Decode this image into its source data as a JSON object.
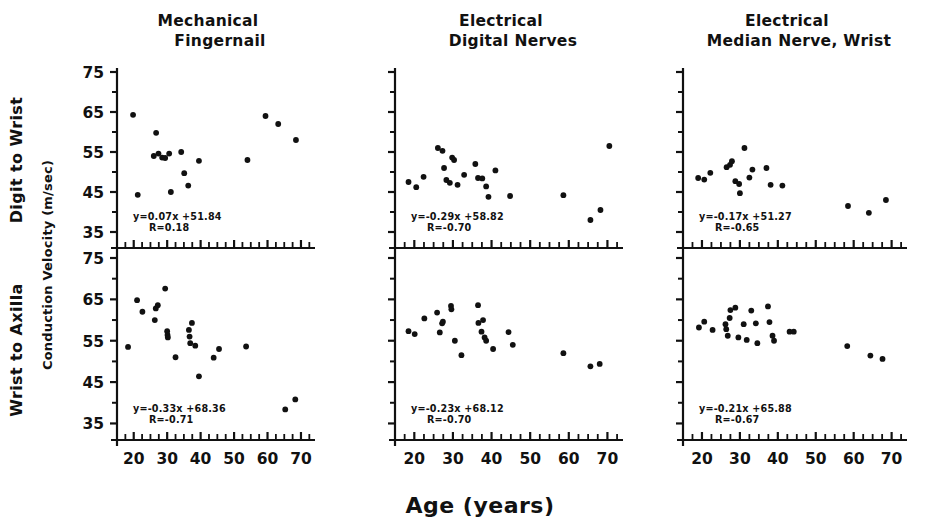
{
  "figure": {
    "x_axis_title": "Age (years)",
    "y_axis_title": "Conduction Velocity (m/sec)",
    "row_labels": [
      "Digit to Wrist",
      "Wrist to Axilla"
    ],
    "column_titles": [
      {
        "line1": "Mechanical",
        "line2": "Fingernail"
      },
      {
        "line1": "Electrical",
        "line2": "Digital Nerves"
      },
      {
        "line1": "Electrical",
        "line2": "Median Nerve, Wrist"
      }
    ],
    "y_ticks": [
      "75",
      "65",
      "55",
      "45",
      "35"
    ],
    "x_ticks": [
      "20",
      "30",
      "40",
      "50",
      "60",
      "70"
    ],
    "ink_color": "#111111",
    "background_color": "#ffffff"
  },
  "chart_data": [
    {
      "id": "panel-top-left",
      "type": "scatter",
      "title": "Mechanical Fingernail",
      "row": "Digit to Wrist",
      "xlabel": "Age (years)",
      "ylabel": "Conduction Velocity (m/sec)",
      "xlim": [
        15,
        73
      ],
      "ylim": [
        31,
        75
      ],
      "xticks": [
        20,
        30,
        40,
        50,
        60,
        70
      ],
      "yticks": [
        35,
        45,
        55,
        65,
        75
      ],
      "grid": false,
      "fit_equation": "y=0.07x +51.84",
      "fit_r": "R=0.18",
      "slope": 0.07,
      "intercept": 51.84,
      "r": 0.18,
      "points": [
        [
          19.8,
          64.3
        ],
        [
          21.2,
          44.3
        ],
        [
          26.0,
          54.0
        ],
        [
          26.7,
          59.8
        ],
        [
          27.4,
          54.6
        ],
        [
          28.5,
          53.6
        ],
        [
          29.4,
          53.5
        ],
        [
          30.6,
          54.6
        ],
        [
          31.1,
          45.0
        ],
        [
          34.2,
          55.0
        ],
        [
          35.1,
          49.7
        ],
        [
          36.3,
          46.6
        ],
        [
          39.5,
          52.8
        ],
        [
          54.0,
          53.0
        ],
        [
          59.4,
          64.0
        ],
        [
          63.2,
          62.0
        ],
        [
          68.5,
          58.0
        ]
      ]
    },
    {
      "id": "panel-top-middle",
      "type": "scatter",
      "title": "Electrical Digital Nerves",
      "row": "Digit to Wrist",
      "xlabel": "Age (years)",
      "ylabel": "Conduction Velocity (m/sec)",
      "xlim": [
        15,
        73
      ],
      "ylim": [
        31,
        75
      ],
      "xticks": [
        20,
        30,
        40,
        50,
        60,
        70
      ],
      "yticks": [
        35,
        45,
        55,
        65,
        75
      ],
      "grid": false,
      "fit_equation": "y=-0.29x +58.82",
      "fit_r": "R=-0.70",
      "slope": -0.29,
      "intercept": 58.82,
      "r": -0.7,
      "points": [
        [
          18.5,
          47.5
        ],
        [
          20.5,
          46.2
        ],
        [
          22.4,
          48.8
        ],
        [
          26.1,
          56.0
        ],
        [
          27.3,
          55.3
        ],
        [
          27.7,
          51.0
        ],
        [
          28.3,
          48.0
        ],
        [
          29.2,
          47.3
        ],
        [
          29.8,
          53.6
        ],
        [
          30.3,
          53.0
        ],
        [
          31.2,
          46.8
        ],
        [
          32.9,
          49.3
        ],
        [
          35.8,
          52.0
        ],
        [
          36.5,
          48.5
        ],
        [
          37.6,
          48.4
        ],
        [
          38.6,
          46.4
        ],
        [
          39.2,
          43.8
        ],
        [
          41.0,
          50.4
        ],
        [
          44.8,
          44.0
        ],
        [
          58.6,
          44.2
        ],
        [
          65.6,
          38.0
        ],
        [
          68.2,
          40.5
        ],
        [
          70.5,
          56.5
        ]
      ]
    },
    {
      "id": "panel-top-right",
      "type": "scatter",
      "title": "Electrical Median Nerve, Wrist",
      "row": "Digit to Wrist",
      "xlabel": "Age (years)",
      "ylabel": "Conduction Velocity (m/sec)",
      "xlim": [
        15,
        73
      ],
      "ylim": [
        31,
        75
      ],
      "xticks": [
        20,
        30,
        40,
        50,
        60,
        70
      ],
      "yticks": [
        35,
        45,
        55,
        65,
        75
      ],
      "grid": false,
      "fit_equation": "y=-0.17x +51.27",
      "fit_r": "R=-0.65",
      "slope": -0.17,
      "intercept": 51.27,
      "r": -0.65,
      "points": [
        [
          19.0,
          48.5
        ],
        [
          20.6,
          48.1
        ],
        [
          22.2,
          49.8
        ],
        [
          26.5,
          51.2
        ],
        [
          27.4,
          51.8
        ],
        [
          27.9,
          52.7
        ],
        [
          28.8,
          47.7
        ],
        [
          29.8,
          47.0
        ],
        [
          30.0,
          44.7
        ],
        [
          31.2,
          56.0
        ],
        [
          32.5,
          48.6
        ],
        [
          33.3,
          50.6
        ],
        [
          37.0,
          51.0
        ],
        [
          38.1,
          46.8
        ],
        [
          41.2,
          46.6
        ],
        [
          58.5,
          41.5
        ],
        [
          64.0,
          39.8
        ],
        [
          68.5,
          43.0
        ]
      ]
    },
    {
      "id": "panel-bottom-left",
      "type": "scatter",
      "title": "Mechanical Fingernail",
      "row": "Wrist to Axilla",
      "xlabel": "Age (years)",
      "ylabel": "Conduction Velocity (m/sec)",
      "xlim": [
        15,
        73
      ],
      "ylim": [
        31,
        75
      ],
      "xticks": [
        20,
        30,
        40,
        50,
        60,
        70
      ],
      "yticks": [
        35,
        45,
        55,
        65,
        75
      ],
      "grid": false,
      "fit_equation": "y=-0.33x +68.36",
      "fit_r": "R=-0.71",
      "slope": -0.33,
      "intercept": 68.36,
      "r": -0.71,
      "points": [
        [
          18.3,
          53.5
        ],
        [
          21.0,
          64.8
        ],
        [
          22.6,
          62.0
        ],
        [
          26.3,
          60.0
        ],
        [
          26.6,
          62.8
        ],
        [
          27.2,
          63.6
        ],
        [
          29.4,
          67.6
        ],
        [
          30.0,
          57.3
        ],
        [
          30.1,
          56.4
        ],
        [
          30.2,
          55.8
        ],
        [
          32.5,
          51.0
        ],
        [
          36.5,
          57.6
        ],
        [
          36.7,
          56.0
        ],
        [
          36.9,
          54.4
        ],
        [
          37.4,
          59.3
        ],
        [
          38.4,
          53.8
        ],
        [
          39.5,
          46.4
        ],
        [
          43.9,
          50.9
        ],
        [
          45.5,
          53.0
        ],
        [
          53.6,
          53.6
        ],
        [
          65.3,
          38.4
        ],
        [
          68.3,
          40.8
        ]
      ]
    },
    {
      "id": "panel-bottom-middle",
      "type": "scatter",
      "title": "Electrical Digital Nerves",
      "row": "Wrist to Axilla",
      "xlabel": "Age (years)",
      "ylabel": "Conduction Velocity (m/sec)",
      "xlim": [
        15,
        73
      ],
      "ylim": [
        31,
        75
      ],
      "xticks": [
        20,
        30,
        40,
        50,
        60,
        70
      ],
      "yticks": [
        35,
        45,
        55,
        65,
        75
      ],
      "grid": false,
      "fit_equation": "y=-0.23x +68.12",
      "fit_r": "R=-0.70",
      "slope": -0.23,
      "intercept": 68.12,
      "r": -0.7,
      "points": [
        [
          18.5,
          57.3
        ],
        [
          20.1,
          56.6
        ],
        [
          22.6,
          60.4
        ],
        [
          25.9,
          61.8
        ],
        [
          26.6,
          57.0
        ],
        [
          27.2,
          59.2
        ],
        [
          27.4,
          59.6
        ],
        [
          29.5,
          63.4
        ],
        [
          29.6,
          62.6
        ],
        [
          30.5,
          55.0
        ],
        [
          32.2,
          51.5
        ],
        [
          36.5,
          63.6
        ],
        [
          36.6,
          59.3
        ],
        [
          37.4,
          57.2
        ],
        [
          37.8,
          60.0
        ],
        [
          38.2,
          55.8
        ],
        [
          38.6,
          55.0
        ],
        [
          40.4,
          53.0
        ],
        [
          44.4,
          57.1
        ],
        [
          45.5,
          54.0
        ],
        [
          58.6,
          52.0
        ],
        [
          65.6,
          48.8
        ],
        [
          68.0,
          49.4
        ]
      ]
    },
    {
      "id": "panel-bottom-right",
      "type": "scatter",
      "title": "Electrical Median Nerve, Wrist",
      "row": "Wrist to Axilla",
      "xlabel": "Age (years)",
      "ylabel": "Conduction Velocity (m/sec)",
      "xlim": [
        15,
        73
      ],
      "ylim": [
        31,
        75
      ],
      "xticks": [
        20,
        30,
        40,
        50,
        60,
        70
      ],
      "yticks": [
        35,
        45,
        55,
        65,
        75
      ],
      "grid": false,
      "fit_equation": "y=-0.21x +65.88",
      "fit_r": "R=-0.67",
      "slope": -0.21,
      "intercept": 65.88,
      "r": -0.67,
      "points": [
        [
          19.2,
          58.2
        ],
        [
          20.6,
          59.6
        ],
        [
          22.8,
          57.6
        ],
        [
          26.2,
          59.0
        ],
        [
          26.4,
          57.8
        ],
        [
          26.8,
          56.2
        ],
        [
          27.3,
          60.5
        ],
        [
          27.5,
          62.4
        ],
        [
          28.8,
          63.0
        ],
        [
          29.6,
          55.8
        ],
        [
          31.0,
          59.0
        ],
        [
          31.8,
          55.2
        ],
        [
          33.0,
          62.3
        ],
        [
          34.2,
          59.2
        ],
        [
          34.6,
          54.4
        ],
        [
          37.4,
          63.3
        ],
        [
          37.8,
          59.5
        ],
        [
          38.6,
          56.2
        ],
        [
          39.0,
          55.0
        ],
        [
          43.1,
          57.2
        ],
        [
          44.2,
          57.2
        ],
        [
          58.3,
          53.7
        ],
        [
          64.4,
          51.4
        ],
        [
          67.6,
          50.6
        ]
      ]
    }
  ]
}
